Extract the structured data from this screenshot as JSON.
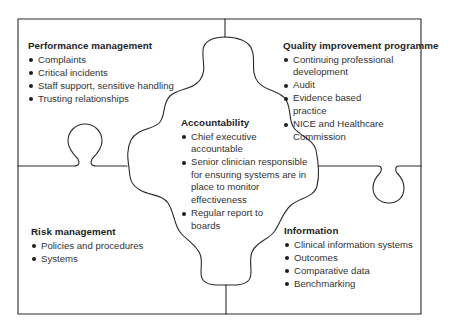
{
  "diagram": {
    "type": "jigsaw-puzzle",
    "line_color": "#2a2a2a",
    "pieces": {
      "performance_management": {
        "title": "Performance management",
        "items": [
          "Complaints",
          "Critical incidents",
          "Staff support, sensitive handling",
          "Trusting relationships"
        ]
      },
      "quality_improvement": {
        "title": "Quality improvement programme",
        "items": [
          "Continuing professional development",
          "Audit",
          "Evidence based practice",
          "NICE and Healthcare Commission"
        ]
      },
      "accountability": {
        "title": "Accountability",
        "items": [
          "Chief executive accountable",
          "Senior clinician responsible for ensuring systems are in place to monitor effectiveness",
          "Regular report to boards"
        ]
      },
      "risk_management": {
        "title": "Risk management",
        "items": [
          "Policies and procedures",
          "Systems"
        ]
      },
      "information": {
        "title": "Information",
        "items": [
          "Clinical information systems",
          "Outcomes",
          "Comparative data",
          "Benchmarking"
        ]
      }
    }
  }
}
